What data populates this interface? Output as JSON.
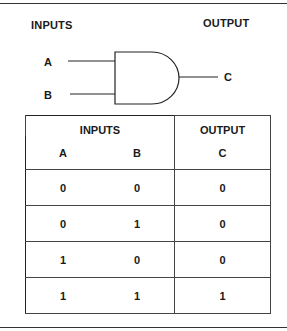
{
  "diagram": {
    "title_inputs": "INPUTS",
    "title_output": "OUTPUT",
    "gate_type": "AND gate",
    "inputs": [
      "A",
      "B"
    ],
    "output": "C"
  },
  "truth_table": {
    "group_headers": {
      "inputs": "INPUTS",
      "output": "OUTPUT"
    },
    "columns": [
      "A",
      "B",
      "C"
    ],
    "rows": [
      [
        "0",
        "0",
        "0"
      ],
      [
        "0",
        "1",
        "0"
      ],
      [
        "1",
        "0",
        "0"
      ],
      [
        "1",
        "1",
        "1"
      ]
    ]
  }
}
